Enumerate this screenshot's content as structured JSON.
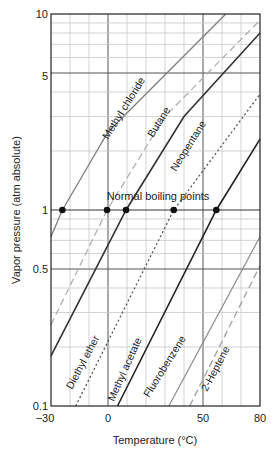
{
  "chart_data": {
    "type": "line",
    "title": "",
    "xlabel": "Temperature (°C)",
    "ylabel": "Vapor pressure (atm absolute)",
    "xlim": [
      -30,
      80
    ],
    "ylim": [
      0.1,
      10
    ],
    "yscale": "log",
    "grid": true,
    "x_ticks": [
      -30,
      0,
      50,
      80
    ],
    "x_tick_labels": [
      "−30",
      "0",
      "50",
      "80"
    ],
    "y_ticks": [
      0.1,
      0.5,
      1,
      5,
      10
    ],
    "y_tick_labels": [
      "0.1",
      "0.5",
      "1",
      "5",
      "10"
    ],
    "annotation": "Normal boiling points",
    "series": [
      {
        "name": "Methyl chloride",
        "style": "solid",
        "color": "#808080",
        "label_pos": "top",
        "points": [
          [
            -30,
            0.73
          ],
          [
            -24,
            1.0
          ],
          [
            0,
            2.5
          ],
          [
            62,
            10
          ]
        ]
      },
      {
        "name": "Butane",
        "style": "dashed",
        "color": "#b0b0b0",
        "label_pos": "top",
        "points": [
          [
            -30,
            0.26
          ],
          [
            -0.5,
            1.0
          ],
          [
            30,
            3.0
          ],
          [
            80,
            9.3
          ]
        ]
      },
      {
        "name": "Neopentane",
        "style": "solid",
        "color": "#333333",
        "label_pos": "top",
        "points": [
          [
            -30,
            0.18
          ],
          [
            9.5,
            1.0
          ],
          [
            40,
            3.0
          ],
          [
            80,
            8.0
          ]
        ]
      },
      {
        "name": "Diethyl ether",
        "style": "dotted",
        "color": "#555555",
        "label_pos": "bottom",
        "points": [
          [
            -17,
            0.1
          ],
          [
            34.6,
            1.0
          ],
          [
            80,
            3.9
          ]
        ]
      },
      {
        "name": "Methyl acetate",
        "style": "solid",
        "color": "#222222",
        "label_pos": "bottom",
        "points": [
          [
            5,
            0.1
          ],
          [
            57,
            1.0
          ],
          [
            80,
            2.3
          ]
        ]
      },
      {
        "name": "Fluorobenzene",
        "style": "solid",
        "color": "#909090",
        "label_pos": "bottom",
        "points": [
          [
            32,
            0.1
          ],
          [
            80,
            0.73
          ]
        ]
      },
      {
        "name": "2-Heptene",
        "style": "dashed",
        "color": "#a0a0a0",
        "label_pos": "bottom",
        "points": [
          [
            43,
            0.1
          ],
          [
            80,
            0.52
          ]
        ]
      }
    ],
    "boiling_points": [
      {
        "name": "Methyl chloride",
        "t": -24,
        "p": 1
      },
      {
        "name": "Butane",
        "t": -0.5,
        "p": 1
      },
      {
        "name": "Neopentane",
        "t": 9.5,
        "p": 1
      },
      {
        "name": "Diethyl ether",
        "t": 34.6,
        "p": 1
      },
      {
        "name": "Methyl acetate",
        "t": 57,
        "p": 1
      }
    ]
  },
  "labels": {
    "xlabel": "Temperature (°C)",
    "ylabel": "Vapor pressure (atm absolute)",
    "annotation": "Normal boiling points",
    "series": [
      "Methyl chloride",
      "Butane",
      "Neopentane",
      "Diethyl ether",
      "Methyl acetate",
      "Fluorobenzene",
      "2-Heptene"
    ],
    "x_ticks": [
      "−30",
      "0",
      "50",
      "80"
    ],
    "y_ticks": [
      "10",
      "5",
      "1",
      "0.5",
      "0.1"
    ]
  }
}
